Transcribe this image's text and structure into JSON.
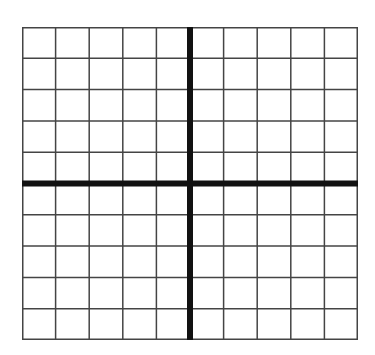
{
  "grid": {
    "columns": 10,
    "rows": 10,
    "left": 22,
    "top": 27,
    "width": 336,
    "height": 313,
    "line_color": "#444444",
    "axis_color": "#111111",
    "line_width": 1.5,
    "axis_width": 6,
    "x_axis_row": 5,
    "y_axis_col": 5
  }
}
